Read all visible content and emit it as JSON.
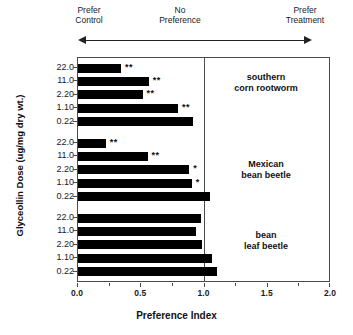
{
  "header": {
    "left_label": "Prefer\nControl",
    "center_label": "No\nPreference",
    "right_label": "Prefer\nTreatment",
    "arrow_icon": "double-headed-arrow"
  },
  "axes": {
    "x_title": "Preference Index",
    "y_title": "Glyceollin Dose (ug/mg dry wt.)",
    "x_ticklabels": [
      "0.0",
      "0.5",
      "1.0",
      "1.5",
      "2.0"
    ],
    "reference_line_value": "1.0"
  },
  "chart_data": {
    "type": "bar",
    "orientation": "horizontal",
    "title": "",
    "xlabel": "Preference Index",
    "ylabel": "Glyceollin Dose (ug/mg dry wt.)",
    "xlim": [
      0.0,
      2.0
    ],
    "xticks": [
      0.0,
      0.5,
      1.0,
      1.5,
      2.0
    ],
    "grid": false,
    "reference_line": 1.0,
    "legend": "none",
    "annotations": {
      "left": "Prefer Control",
      "center": "No Preference",
      "right": "Prefer Treatment",
      "significance_key": [
        "*",
        "**"
      ]
    },
    "groups": [
      {
        "name": "southern\ncorn rootworm",
        "label_plain": "southern corn rootworm",
        "categories": [
          "22.0",
          "11.0",
          "2.20",
          "1.10",
          "0.22"
        ],
        "values": [
          0.34,
          0.56,
          0.51,
          0.79,
          0.91
        ],
        "significance": [
          "**",
          "**",
          "**",
          "**",
          ""
        ]
      },
      {
        "name": "Mexican\nbean beetle",
        "label_plain": "Mexican bean beetle",
        "categories": [
          "22.0",
          "11.0",
          "2.20",
          "1.10",
          "0.22"
        ],
        "values": [
          0.22,
          0.55,
          0.88,
          0.9,
          1.04
        ],
        "significance": [
          "**",
          "**",
          "*",
          "*",
          ""
        ]
      },
      {
        "name": "bean\nleaf beetle",
        "label_plain": "bean leaf beetle",
        "categories": [
          "22.0",
          "11.0",
          "2.20",
          "1.10",
          "0.22"
        ],
        "values": [
          0.97,
          0.93,
          0.98,
          1.06,
          1.1
        ],
        "significance": [
          "",
          "",
          "",
          "",
          ""
        ]
      }
    ]
  }
}
